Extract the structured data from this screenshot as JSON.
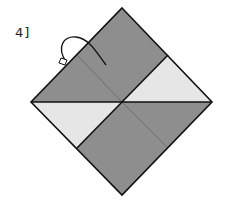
{
  "step_label": "4]",
  "colors": {
    "dark": "#8e8e8e",
    "light": "#e6e6e6",
    "line": "#111111",
    "crease": "#6e6e6e"
  },
  "diagram": {
    "regions": [
      "top-quadrant-dark",
      "right-triangle-light",
      "left-triangle-light",
      "bottom-quadrant-dark"
    ]
  }
}
